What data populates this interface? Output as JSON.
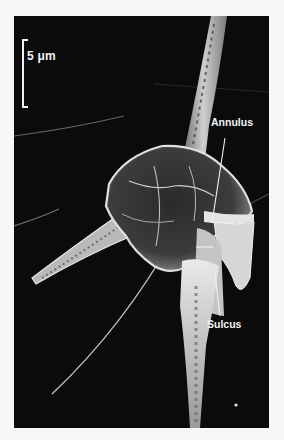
{
  "figure": {
    "scale_bar": {
      "label": "5 μm",
      "value": 5,
      "unit": "μm"
    },
    "annotations": [
      {
        "id": "annulus",
        "label": "Annulus"
      },
      {
        "id": "sulcus",
        "label": "Sulcus"
      }
    ],
    "colors": {
      "background_frame": "#0b0b0b",
      "page": "#f7f7f5",
      "specimen_highlight": "#e6e6e6",
      "label": "#f4f4f4"
    }
  }
}
